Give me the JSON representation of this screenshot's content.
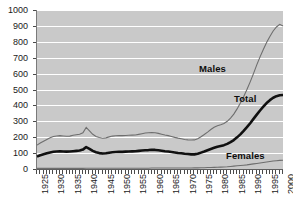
{
  "chart": {
    "title": "",
    "background_color": "#ffffff",
    "plot_background_color": "#c9c9c9",
    "gridline_color": "#ffffff",
    "axis_color": "#4a4a4a"
  },
  "annotations": {
    "males_label": "Males",
    "total_label": "Total",
    "females_label": "Females"
  },
  "chart_data": {
    "type": "line",
    "title": "",
    "subtitle": "",
    "xlabel": "",
    "ylabel": "",
    "xlim": [
      1925,
      2000
    ],
    "ylim": [
      0,
      1000
    ],
    "grid": true,
    "grid_axis": "y",
    "legend": "inline-annotations",
    "y_ticks": [
      0,
      100,
      200,
      300,
      400,
      500,
      600,
      700,
      800,
      900,
      1000
    ],
    "x_ticks": [
      1925,
      1930,
      1935,
      1940,
      1945,
      1950,
      1955,
      1960,
      1965,
      1970,
      1975,
      1980,
      1985,
      1990,
      1995,
      2000
    ],
    "x_minor_tick_interval": 1,
    "x": [
      1925,
      1926,
      1927,
      1928,
      1929,
      1930,
      1931,
      1932,
      1933,
      1934,
      1935,
      1936,
      1937,
      1938,
      1939,
      1940,
      1941,
      1942,
      1943,
      1944,
      1945,
      1946,
      1947,
      1948,
      1949,
      1950,
      1951,
      1952,
      1953,
      1954,
      1955,
      1956,
      1957,
      1958,
      1959,
      1960,
      1961,
      1962,
      1963,
      1964,
      1965,
      1966,
      1967,
      1968,
      1969,
      1970,
      1971,
      1972,
      1973,
      1974,
      1975,
      1976,
      1977,
      1978,
      1979,
      1980,
      1981,
      1982,
      1983,
      1984,
      1985,
      1986,
      1987,
      1988,
      1989,
      1990,
      1991,
      1992,
      1993,
      1994,
      1995,
      1996,
      1997,
      1998,
      1999,
      2000
    ],
    "series": [
      {
        "name": "Males",
        "color": "#6e6e6e",
        "line_width": 1,
        "values": [
          150,
          163,
          175,
          186,
          196,
          205,
          208,
          210,
          208,
          206,
          207,
          212,
          215,
          218,
          228,
          262,
          240,
          218,
          205,
          198,
          193,
          196,
          202,
          207,
          209,
          210,
          210,
          211,
          212,
          213,
          214,
          218,
          222,
          226,
          228,
          230,
          228,
          224,
          219,
          214,
          210,
          205,
          199,
          194,
          190,
          186,
          183,
          182,
          183,
          190,
          203,
          217,
          232,
          248,
          262,
          272,
          278,
          286,
          300,
          320,
          345,
          378,
          415,
          455,
          500,
          548,
          600,
          655,
          705,
          752,
          795,
          833,
          868,
          893,
          910,
          900
        ]
      },
      {
        "name": "Total",
        "color": "#101010",
        "line_width": 3,
        "values": [
          78,
          86,
          93,
          99,
          104,
          108,
          110,
          111,
          110,
          109,
          110,
          112,
          114,
          116,
          122,
          138,
          127,
          114,
          105,
          100,
          97,
          99,
          102,
          105,
          107,
          108,
          108,
          109,
          110,
          111,
          112,
          114,
          116,
          118,
          119,
          121,
          120,
          118,
          115,
          112,
          110,
          107,
          104,
          101,
          99,
          96,
          94,
          92,
          92,
          96,
          103,
          110,
          118,
          126,
          133,
          140,
          145,
          150,
          158,
          169,
          182,
          199,
          218,
          240,
          263,
          288,
          315,
          342,
          368,
          392,
          415,
          433,
          448,
          458,
          464,
          465
        ]
      },
      {
        "name": "Females",
        "color": "#6e6e6e",
        "line_width": 1,
        "values": [
          4,
          4,
          4,
          4,
          4,
          4,
          4,
          4,
          4,
          4,
          4,
          4,
          4,
          4,
          4,
          5,
          5,
          5,
          5,
          5,
          5,
          5,
          5,
          5,
          5,
          5,
          5,
          5,
          5,
          5,
          5,
          5,
          5,
          5,
          5,
          6,
          6,
          6,
          6,
          6,
          6,
          6,
          6,
          6,
          6,
          6,
          6,
          6,
          7,
          7,
          8,
          8,
          9,
          9,
          10,
          11,
          12,
          13,
          14,
          16,
          18,
          20,
          22,
          24,
          26,
          29,
          32,
          35,
          38,
          41,
          44,
          47,
          50,
          52,
          54,
          55
        ]
      }
    ]
  }
}
